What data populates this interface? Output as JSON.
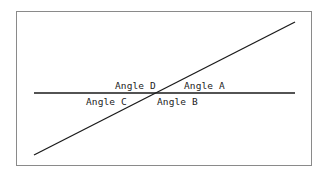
{
  "diagram": {
    "type": "intersecting-lines",
    "frame": {
      "border_color": "#8a8a8a"
    },
    "lines": [
      {
        "name": "horizontal-line",
        "x1": 34,
        "y1": 93,
        "x2": 295,
        "y2": 93,
        "color": "#1a1a1a"
      },
      {
        "name": "diagonal-line",
        "x1": 34,
        "y1": 155,
        "x2": 295,
        "y2": 22,
        "color": "#1a1a1a"
      }
    ],
    "intersection": {
      "x": 157,
      "y": 93
    },
    "labels": {
      "angle_a": "Angle A",
      "angle_b": "Angle B",
      "angle_c": "Angle C",
      "angle_d": "Angle D"
    }
  }
}
